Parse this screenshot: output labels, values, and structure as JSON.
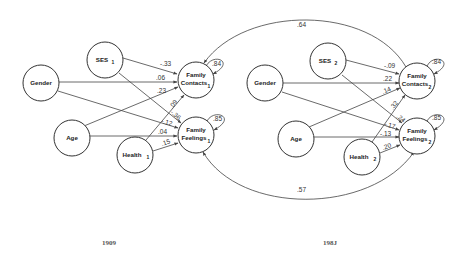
{
  "colors": {
    "line": "#444444",
    "node_stroke": "#333333",
    "text": "#222222",
    "background": "#ffffff"
  },
  "panels": [
    {
      "year_label": "1909",
      "nodes": {
        "gender": {
          "label": "Gender",
          "sub": ""
        },
        "ses": {
          "label": "SES",
          "sub": "1"
        },
        "age": {
          "label": "Age",
          "sub": ""
        },
        "health": {
          "label": "Health",
          "sub": "1"
        },
        "family_contacts": {
          "label1": "Family",
          "label2": "Contacts",
          "sub": "1",
          "residual": ".84"
        },
        "family_feelings": {
          "label1": "Family",
          "label2": "Feelings",
          "sub": "1",
          "residual": ".85"
        }
      },
      "paths": {
        "ses_to_contacts": "-.33",
        "gender_to_contacts": ".06",
        "age_to_contacts": ".23",
        "health_to_contacts": ".09",
        "ses_to_feelings": "-.36",
        "gender_to_feelings": "-.12",
        "age_to_feelings": ".04",
        "health_to_feelings": ".15"
      }
    },
    {
      "year_label": "198J",
      "nodes": {
        "gender": {
          "label": "Gender",
          "sub": ""
        },
        "ses": {
          "label": "SES",
          "sub": "2"
        },
        "age": {
          "label": "Age",
          "sub": ""
        },
        "health": {
          "label": "Health",
          "sub": "2"
        },
        "family_contacts": {
          "label1": "Family",
          "label2": "Contacts",
          "sub": "2",
          "residual": ".84"
        },
        "family_feelings": {
          "label1": "Family",
          "label2": "Feelings",
          "sub": "2",
          "residual": ".85"
        }
      },
      "paths": {
        "ses_to_contacts": "-.09",
        "gender_to_contacts": ".22",
        "age_to_contacts": ".14",
        "health_to_contacts": ".32",
        "ses_to_feelings": ".24",
        "gender_to_feelings": "-.17",
        "age_to_feelings": "-.13",
        "health_to_feelings": ".20"
      }
    }
  ],
  "stability": {
    "contacts": ".64",
    "feelings": ".57"
  }
}
